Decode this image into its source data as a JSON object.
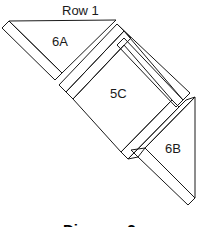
{
  "diagram": {
    "row_label": "Row 1",
    "pieces": [
      {
        "id": "6A",
        "label": "6A",
        "shape": "triangle"
      },
      {
        "id": "5C",
        "label": "5C",
        "shape": "square"
      },
      {
        "id": "6B",
        "label": "6B",
        "shape": "triangle"
      }
    ],
    "caption": "Diagram 2"
  },
  "colors": {
    "line": "#1a1a1a",
    "background": "#ffffff"
  }
}
